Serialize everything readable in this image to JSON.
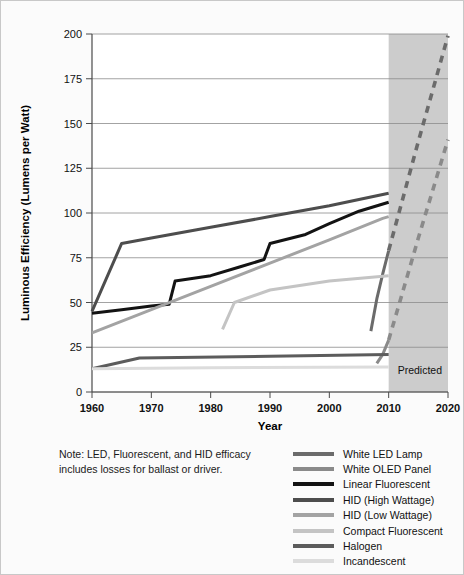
{
  "chart_data": {
    "type": "line",
    "title": "",
    "xlabel": "Year",
    "ylabel": "Luminous Efficiency (Lumens per Watt)",
    "xlim": [
      1960,
      2020
    ],
    "ylim": [
      0,
      200
    ],
    "xticks": [
      1960,
      1970,
      1980,
      1990,
      2000,
      2010,
      2020
    ],
    "yticks": [
      0,
      25,
      50,
      75,
      100,
      125,
      150,
      175,
      200
    ],
    "grid": true,
    "legend_position": "bottom-right",
    "shaded_region": {
      "label": "Predicted",
      "x_start": 2010,
      "x_end": 2020,
      "color": "#cccccc"
    },
    "note": "Note: LED, Fluorescent, and HID efficacy includes losses for ballast or driver.",
    "series": [
      {
        "name": "White LED Lamp",
        "color": "#6b6b6b",
        "solid": [
          {
            "x": 2007,
            "y": 34
          },
          {
            "x": 2008,
            "y": 52
          },
          {
            "x": 2009,
            "y": 66
          },
          {
            "x": 2010,
            "y": 79
          }
        ],
        "dashed": [
          {
            "x": 2010,
            "y": 79
          },
          {
            "x": 2015,
            "y": 140
          },
          {
            "x": 2020,
            "y": 199
          }
        ]
      },
      {
        "name": "White OLED Panel",
        "color": "#8a8a8a",
        "solid": [
          {
            "x": 2008,
            "y": 16
          },
          {
            "x": 2009,
            "y": 21
          },
          {
            "x": 2010,
            "y": 29
          }
        ],
        "dashed": [
          {
            "x": 2010,
            "y": 29
          },
          {
            "x": 2015,
            "y": 86
          },
          {
            "x": 2020,
            "y": 141
          }
        ]
      },
      {
        "name": "Linear Fluorescent",
        "color": "#131313",
        "solid": [
          {
            "x": 1960,
            "y": 44
          },
          {
            "x": 1965,
            "y": 46
          },
          {
            "x": 1970,
            "y": 48
          },
          {
            "x": 1973,
            "y": 49
          },
          {
            "x": 1974,
            "y": 62
          },
          {
            "x": 1980,
            "y": 65
          },
          {
            "x": 1985,
            "y": 70
          },
          {
            "x": 1989,
            "y": 74
          },
          {
            "x": 1990,
            "y": 83
          },
          {
            "x": 1996,
            "y": 88
          },
          {
            "x": 2000,
            "y": 94
          },
          {
            "x": 2005,
            "y": 101
          },
          {
            "x": 2010,
            "y": 106
          }
        ],
        "dashed": []
      },
      {
        "name": "HID (High Wattage)",
        "color": "#4d4d4d",
        "solid": [
          {
            "x": 1960,
            "y": 45
          },
          {
            "x": 1965,
            "y": 83
          },
          {
            "x": 1970,
            "y": 86
          },
          {
            "x": 1980,
            "y": 92
          },
          {
            "x": 1990,
            "y": 98
          },
          {
            "x": 2000,
            "y": 104
          },
          {
            "x": 2010,
            "y": 111
          }
        ],
        "dashed": []
      },
      {
        "name": "HID (Low Wattage)",
        "color": "#a3a3a3",
        "solid": [
          {
            "x": 1960,
            "y": 33
          },
          {
            "x": 1970,
            "y": 46
          },
          {
            "x": 1980,
            "y": 59
          },
          {
            "x": 1990,
            "y": 72
          },
          {
            "x": 2000,
            "y": 85
          },
          {
            "x": 2009,
            "y": 97
          },
          {
            "x": 2010,
            "y": 98
          }
        ],
        "dashed": []
      },
      {
        "name": "Compact Fluorescent",
        "color": "#c4c4c4",
        "solid": [
          {
            "x": 1982,
            "y": 35
          },
          {
            "x": 1984,
            "y": 50
          },
          {
            "x": 1990,
            "y": 57
          },
          {
            "x": 2000,
            "y": 62
          },
          {
            "x": 2010,
            "y": 65
          }
        ],
        "dashed": []
      },
      {
        "name": "Halogen",
        "color": "#5c5c5c",
        "solid": [
          {
            "x": 1960,
            "y": 13
          },
          {
            "x": 1968,
            "y": 19
          },
          {
            "x": 1990,
            "y": 20
          },
          {
            "x": 2010,
            "y": 21
          }
        ],
        "dashed": []
      },
      {
        "name": "Incandescent",
        "color": "#dcdcdc",
        "solid": [
          {
            "x": 1960,
            "y": 13
          },
          {
            "x": 1980,
            "y": 13.5
          },
          {
            "x": 2010,
            "y": 14
          }
        ],
        "dashed": []
      }
    ]
  },
  "legend": {
    "items": [
      {
        "label": "White LED Lamp",
        "color": "#6b6b6b"
      },
      {
        "label": "White OLED Panel",
        "color": "#8a8a8a"
      },
      {
        "label": "Linear Fluorescent",
        "color": "#131313"
      },
      {
        "label": "HID (High Wattage)",
        "color": "#4d4d4d"
      },
      {
        "label": "HID (Low Wattage)",
        "color": "#a3a3a3"
      },
      {
        "label": "Compact Fluorescent",
        "color": "#c4c4c4"
      },
      {
        "label": "Halogen",
        "color": "#5c5c5c"
      },
      {
        "label": "Incandescent",
        "color": "#dcdcdc"
      }
    ]
  },
  "note": {
    "line1": "Note: LED, Fluorescent, and HID efficacy",
    "line2": "includes losses for ballast or driver."
  }
}
